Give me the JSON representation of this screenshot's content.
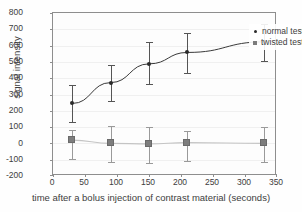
{
  "chart_data": {
    "type": "line",
    "title": "",
    "xlabel": "time after a bolus injection of contrast material (seconds)",
    "ylabel": "signal intensity",
    "xlim": [
      0,
      350
    ],
    "ylim": [
      -200,
      800
    ],
    "xticks": [
      0,
      50,
      100,
      150,
      200,
      250,
      300,
      350
    ],
    "yticks": [
      -200,
      -100,
      0,
      100,
      200,
      300,
      400,
      500,
      600,
      700,
      800
    ],
    "grid": true,
    "legend_position": "top-right",
    "x": [
      30,
      90,
      150,
      210,
      330
    ],
    "series": [
      {
        "name": "normal testis",
        "marker": "circle",
        "color": "#2b2b2b",
        "values": [
          245,
          373,
          488,
          558,
          623
        ],
        "err_upper": [
          360,
          478,
          620,
          680,
          735
        ],
        "err_lower": [
          130,
          258,
          365,
          432,
          508
        ]
      },
      {
        "name": "twisted testis",
        "marker": "square",
        "color": "#7d7d7d",
        "values": [
          20,
          0,
          -3,
          5,
          0
        ],
        "err_upper": [
          80,
          108,
          98,
          78,
          98
        ],
        "err_lower": [
          -95,
          -115,
          -120,
          -105,
          -112
        ]
      }
    ]
  },
  "legend": {
    "entries": [
      {
        "label": "normal testis",
        "marker": "dot"
      },
      {
        "label": "twisted testis",
        "marker": "square"
      }
    ]
  },
  "axes": {
    "y_tick_labels": [
      "800",
      "700",
      "600",
      "500",
      "400",
      "300",
      "200",
      "100",
      "0",
      "-100",
      "-200"
    ],
    "x_tick_labels": [
      "0",
      "50",
      "100",
      "150",
      "200",
      "250",
      "300",
      "350"
    ]
  }
}
